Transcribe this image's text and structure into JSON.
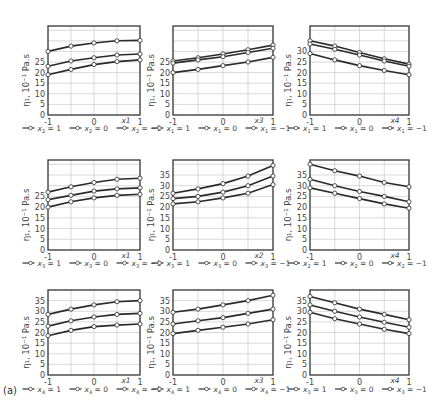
{
  "figure_label": "(a)",
  "chart_data": [
    {
      "type": "line",
      "row": 0,
      "col": 0,
      "xlabel": "x1",
      "ylabel": "η₁, 10⁻¹ Pa.s",
      "xticks": [
        "-1",
        "0",
        "1"
      ],
      "yticks": [
        0,
        5,
        10,
        15,
        20,
        25
      ],
      "ylim": [
        0,
        42
      ],
      "x": [
        -1,
        -0.5,
        0,
        0.5,
        1
      ],
      "legend_var": "x",
      "legend_sub": "2",
      "series": [
        {
          "name": "x₂ = 1",
          "values": [
            30,
            32.5,
            34,
            35,
            35.2
          ]
        },
        {
          "name": "x₂ = 0",
          "values": [
            23,
            25.5,
            27,
            28.3,
            28.8
          ]
        },
        {
          "name": "x₂ = −1",
          "values": [
            19,
            21.5,
            23.8,
            25.2,
            26
          ]
        }
      ]
    },
    {
      "type": "line",
      "row": 0,
      "col": 1,
      "xlabel": "x3",
      "ylabel": "η₁, 10⁻¹ Pa.s",
      "xticks": [
        "-1",
        "0",
        "1"
      ],
      "yticks": [
        0,
        5,
        10,
        15,
        20,
        25
      ],
      "ylim": [
        0,
        42
      ],
      "x": [
        -1,
        -0.5,
        0,
        0.5,
        1
      ],
      "legend_var": "x",
      "legend_sub": "1",
      "series": [
        {
          "name": "x₁ = 1",
          "values": [
            25.5,
            27,
            28.8,
            30.8,
            33
          ]
        },
        {
          "name": "x₁ = 0",
          "values": [
            24.5,
            26,
            27.5,
            29.5,
            31.5
          ]
        },
        {
          "name": "x₁ = −1",
          "values": [
            20,
            21.5,
            23.3,
            25,
            27.2
          ]
        }
      ]
    },
    {
      "type": "line",
      "row": 0,
      "col": 2,
      "xlabel": "x4",
      "ylabel": "η₁, 10⁻¹ Pa.s",
      "xticks": [
        "-1",
        "0",
        "1"
      ],
      "yticks": [
        0,
        5,
        10,
        15,
        20,
        25,
        30
      ],
      "ylim": [
        0,
        42
      ],
      "x": [
        -1,
        -0.5,
        0,
        0.5,
        1
      ],
      "legend_var": "x",
      "legend_sub": "1",
      "series": [
        {
          "name": "x₁ = 1",
          "values": [
            35,
            32.5,
            29.5,
            26.5,
            24
          ]
        },
        {
          "name": "x₁ = 0",
          "values": [
            33.5,
            31,
            28.3,
            25.5,
            23
          ]
        },
        {
          "name": "x₁ = −1",
          "values": [
            29,
            26,
            23.3,
            21,
            19
          ]
        }
      ]
    },
    {
      "type": "line",
      "row": 1,
      "col": 0,
      "xlabel": "x1",
      "ylabel": "η₁, 10⁻¹ Pa.s",
      "xticks": [
        "-1",
        "0",
        "1"
      ],
      "yticks": [
        0,
        5,
        10,
        15,
        20,
        25
      ],
      "ylim": [
        0,
        42
      ],
      "x": [
        -1,
        -0.5,
        0,
        0.5,
        1
      ],
      "legend_var": "x",
      "legend_sub": "3",
      "series": [
        {
          "name": "x₃ = 1",
          "values": [
            27,
            29.5,
            31.5,
            33,
            33.5
          ]
        },
        {
          "name": "x₃ = 0",
          "values": [
            23.5,
            25.5,
            27.5,
            28.5,
            29
          ]
        },
        {
          "name": "x₃ = −1",
          "values": [
            20,
            22.5,
            24.3,
            25.5,
            26
          ]
        }
      ]
    },
    {
      "type": "line",
      "row": 1,
      "col": 1,
      "xlabel": "x2",
      "ylabel": "η₁, 10⁻¹ Pa.s",
      "xticks": [
        "-1",
        "0",
        "1"
      ],
      "yticks": [
        0,
        5,
        10,
        15,
        20,
        25,
        30,
        35
      ],
      "ylim": [
        0,
        42
      ],
      "x": [
        -1,
        -0.5,
        0,
        0.5,
        1
      ],
      "legend_var": "x",
      "legend_sub": "3",
      "series": [
        {
          "name": "x₃ = 1",
          "values": [
            26.5,
            28.5,
            31,
            34.5,
            39.5
          ]
        },
        {
          "name": "x₃ = 0",
          "values": [
            24,
            25,
            27,
            30,
            34.5
          ]
        },
        {
          "name": "x₃ = −1",
          "values": [
            21.5,
            22.5,
            24.3,
            26.5,
            30.5
          ]
        }
      ]
    },
    {
      "type": "line",
      "row": 1,
      "col": 2,
      "xlabel": "x4",
      "ylabel": "η₁, 10⁻¹ Pa.s",
      "xticks": [
        "-1",
        "0",
        "1"
      ],
      "yticks": [
        0,
        5,
        10,
        15,
        20,
        25,
        30,
        35
      ],
      "ylim": [
        0,
        42
      ],
      "x": [
        -1,
        -0.5,
        0,
        0.5,
        1
      ],
      "legend_var": "x",
      "legend_sub": "2",
      "series": [
        {
          "name": "x₂ = 1",
          "values": [
            40,
            37,
            34.5,
            31.5,
            29.5
          ]
        },
        {
          "name": "x₂ = 0",
          "values": [
            33,
            30,
            27.3,
            25,
            22.5
          ]
        },
        {
          "name": "x₂ = −1",
          "values": [
            29,
            26.5,
            24,
            21.5,
            19.5
          ]
        }
      ]
    },
    {
      "type": "line",
      "row": 2,
      "col": 0,
      "xlabel": "x1",
      "ylabel": "η₁, 10⁻¹ Pa.s",
      "xticks": [
        "-1",
        "0",
        "1"
      ],
      "yticks": [
        0,
        5,
        10,
        15,
        20,
        25,
        30,
        35
      ],
      "ylim": [
        0,
        40
      ],
      "x": [
        -1,
        -0.5,
        0,
        0.5,
        1
      ],
      "legend_var": "x",
      "legend_sub": "4",
      "series": [
        {
          "name": "x₄ = 1",
          "values": [
            28.5,
            31,
            33,
            34.5,
            35
          ]
        },
        {
          "name": "x₄ = 0",
          "values": [
            23,
            25.5,
            27.3,
            28.5,
            29
          ]
        },
        {
          "name": "x₄ = −1",
          "values": [
            18.5,
            21,
            22.8,
            23.5,
            24
          ]
        }
      ]
    },
    {
      "type": "line",
      "row": 2,
      "col": 1,
      "xlabel": "x3",
      "ylabel": "η₁, 10⁻¹ Pa.s",
      "xticks": [
        "-1",
        "0",
        "1"
      ],
      "yticks": [
        0,
        5,
        10,
        15,
        20,
        25,
        30,
        35
      ],
      "ylim": [
        0,
        40
      ],
      "x": [
        -1,
        -0.5,
        0,
        0.5,
        1
      ],
      "legend_var": "x",
      "legend_sub": "4",
      "series": [
        {
          "name": "x₄ = 1",
          "values": [
            29.5,
            31,
            33,
            35,
            37.5
          ]
        },
        {
          "name": "x₄ = 0",
          "values": [
            24,
            25.5,
            27,
            29,
            31
          ]
        },
        {
          "name": "x₄ = −1",
          "values": [
            19.5,
            21,
            22.5,
            24,
            26
          ]
        }
      ]
    },
    {
      "type": "line",
      "row": 2,
      "col": 2,
      "xlabel": "x4",
      "ylabel": "η₁, 10⁻¹ Pa.s",
      "xticks": [
        "-1",
        "0",
        "1"
      ],
      "yticks": [
        0,
        5,
        10,
        15,
        20,
        25,
        30,
        35
      ],
      "ylim": [
        0,
        40
      ],
      "x": [
        -1,
        -0.5,
        0,
        0.5,
        1
      ],
      "legend_var": "x",
      "legend_sub": "3",
      "series": [
        {
          "name": "x₃ = 1",
          "values": [
            37,
            34,
            31,
            28.5,
            26
          ]
        },
        {
          "name": "x₃ = 0",
          "values": [
            33,
            30,
            27.3,
            24.8,
            22.5
          ]
        },
        {
          "name": "x₃ = −1",
          "values": [
            29.5,
            26.5,
            24,
            21.5,
            19.5
          ]
        }
      ]
    }
  ],
  "legend_values": [
    "1",
    "0",
    "−1"
  ],
  "layout": {
    "cols": [
      {
        "left": 48,
        "right": 140
      },
      {
        "left": 173,
        "right": 273
      },
      {
        "left": 310,
        "right": 409
      }
    ],
    "rows": [
      {
        "top": 26,
        "bottom": 115,
        "legend_y": 131
      },
      {
        "top": 160,
        "bottom": 250,
        "legend_y": 266
      },
      {
        "top": 290,
        "bottom": 375,
        "legend_y": 392
      }
    ]
  }
}
